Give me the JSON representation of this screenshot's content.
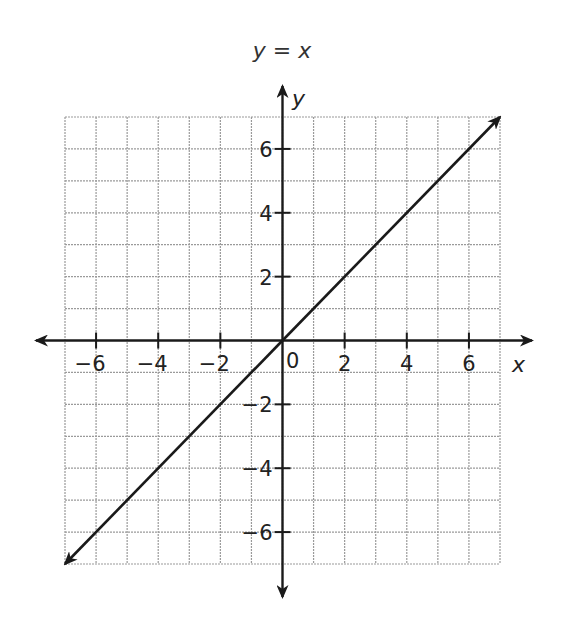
{
  "chart_data": {
    "type": "line",
    "title": "y = x",
    "xlabel": "x",
    "ylabel": "y",
    "xlim": [
      -7,
      7
    ],
    "ylim": [
      -7,
      7
    ],
    "grid": true,
    "x_ticks": [
      -6,
      -4,
      -2,
      2,
      4,
      6
    ],
    "y_ticks": [
      -6,
      -4,
      -2,
      2,
      4,
      6
    ],
    "x_tick_labels": [
      "−6",
      "−4",
      "−2",
      "2",
      "4",
      "6"
    ],
    "y_tick_labels": [
      "−6",
      "−4",
      "−2",
      "2",
      "4",
      "6"
    ],
    "origin_label": "0",
    "series": [
      {
        "name": "y = x",
        "x": [
          -7,
          7
        ],
        "y": [
          -7,
          7
        ],
        "arrows": "both"
      }
    ],
    "colors": {
      "line": "#1a1a1a",
      "grid": "#9a9a9a",
      "axis": "#1a1a1a"
    }
  }
}
